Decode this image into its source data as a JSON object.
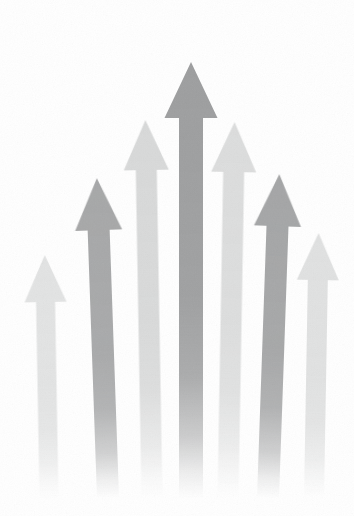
{
  "canvas": {
    "width": 354,
    "height": 516,
    "background_color": "#ffffff",
    "title": "Seven Upward Arrows Growth Illustration"
  },
  "style": {
    "fade_start_pct": 55,
    "fade_end_pct": 100,
    "texture": "grainy-paper",
    "arrow_direction": "up"
  },
  "chart_data": {
    "type": "bar",
    "title": "Seven Upward Arrows Growth Illustration",
    "subtitle": "",
    "xlabel": "",
    "ylabel": "",
    "categories": [
      "1",
      "2",
      "3",
      "4",
      "5",
      "6",
      "7"
    ],
    "values": [
      236,
      318,
      372,
      420,
      368,
      310,
      252
    ],
    "ylim": [
      0,
      460
    ],
    "grid": false,
    "legend": "none",
    "note": "values are arrow heights in pixels measured from the faded baseline at y=498 to each arrow tip"
  },
  "arrows": [
    {
      "id": "arrow-1",
      "label": "Arrow 1",
      "center_x": 49,
      "tip_y": 255,
      "base_y": 498,
      "shaft_width": 19,
      "head_width": 42,
      "head_height": 47,
      "color": "#e2e3e3",
      "tone": "very-light",
      "tilt": -1.0
    },
    {
      "id": "arrow-2",
      "label": "Arrow 2",
      "center_x": 108,
      "tip_y": 178,
      "base_y": 498,
      "shaft_width": 22,
      "head_width": 47,
      "head_height": 52,
      "color": "#a6a7a8",
      "tone": "medium",
      "tilt": -2.0
    },
    {
      "id": "arrow-3",
      "label": "Arrow 3",
      "center_x": 152,
      "tip_y": 120,
      "base_y": 498,
      "shaft_width": 21,
      "head_width": 45,
      "head_height": 50,
      "color": "#d8d9d9",
      "tone": "light",
      "tilt": -1.0
    },
    {
      "id": "arrow-4",
      "label": "Arrow 4",
      "center_x": 191,
      "tip_y": 62,
      "base_y": 498,
      "shaft_width": 24,
      "head_width": 53,
      "head_height": 56,
      "color": "#9d9e9f",
      "tone": "dark",
      "tilt": 0.0
    },
    {
      "id": "arrow-5",
      "label": "Arrow 5",
      "center_x": 228,
      "tip_y": 122,
      "base_y": 498,
      "shaft_width": 21,
      "head_width": 45,
      "head_height": 50,
      "color": "#dcdddd",
      "tone": "light",
      "tilt": 1.0
    },
    {
      "id": "arrow-6",
      "label": "Arrow 6",
      "center_x": 268,
      "tip_y": 174,
      "base_y": 498,
      "shaft_width": 22,
      "head_width": 47,
      "head_height": 52,
      "color": "#a4a5a6",
      "tone": "medium",
      "tilt": 2.0
    },
    {
      "id": "arrow-7",
      "label": "Arrow 7",
      "center_x": 314,
      "tip_y": 233,
      "base_y": 498,
      "shaft_width": 20,
      "head_width": 42,
      "head_height": 47,
      "color": "#e0e1e1",
      "tone": "very-light",
      "tilt": 1.0
    }
  ]
}
